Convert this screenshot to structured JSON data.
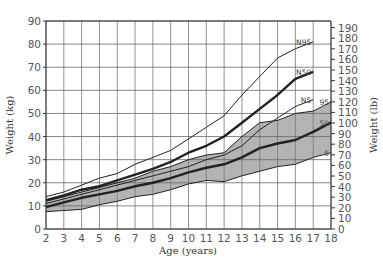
{
  "chart_data": {
    "type": "line",
    "title": "",
    "xlabel": "Age (years)",
    "ylabel": "Weight (kg)",
    "ylabel_right": "Weight (lb)",
    "xlim": [
      2,
      18
    ],
    "ylim": [
      0,
      90
    ],
    "ylim_right": [
      0,
      190
    ],
    "x_ticks": [
      2,
      3,
      4,
      5,
      6,
      7,
      8,
      9,
      10,
      11,
      12,
      13,
      14,
      15,
      16,
      17,
      18
    ],
    "y_ticks": [
      0,
      10,
      20,
      30,
      40,
      50,
      60,
      70,
      80,
      90
    ],
    "y_ticks_right": [
      0,
      10,
      20,
      30,
      40,
      50,
      60,
      70,
      80,
      90,
      100,
      110,
      120,
      130,
      140,
      150,
      160,
      170,
      180,
      190
    ],
    "grid": true,
    "legend": "inline labels at right end of curves",
    "shaded_band": {
      "between": [
        "5",
        "95"
      ],
      "color": "#b3b3b3"
    },
    "series": [
      {
        "name": "N95",
        "style": "thin",
        "x": [
          2,
          3,
          4,
          5,
          6,
          7,
          8,
          9,
          10,
          11,
          12,
          13,
          14,
          15,
          16,
          17
        ],
        "values": [
          14,
          16,
          19,
          22,
          24,
          28,
          31,
          34,
          39,
          44,
          49,
          58,
          66,
          74,
          78,
          81
        ]
      },
      {
        "name": "N50",
        "style": "thick",
        "x": [
          2,
          3,
          4,
          5,
          6,
          7,
          8,
          9,
          10,
          11,
          12,
          13,
          14,
          15,
          16,
          17
        ],
        "values": [
          12.5,
          14.5,
          17,
          18.5,
          21,
          23.5,
          26,
          29,
          33,
          36,
          40,
          46,
          52,
          58,
          65,
          68
        ]
      },
      {
        "name": "N5",
        "style": "thin",
        "x": [
          2,
          3,
          4,
          5,
          6,
          7,
          8,
          9,
          10,
          11,
          12,
          13,
          14,
          15,
          16,
          17
        ],
        "values": [
          11,
          13,
          15,
          17,
          19,
          21,
          23,
          25,
          27,
          30,
          32,
          36,
          43,
          48,
          53,
          56
        ]
      },
      {
        "name": "95",
        "style": "thin",
        "x": [
          2,
          3,
          4,
          5,
          6,
          7,
          8,
          9,
          10,
          11,
          12,
          13,
          14,
          15,
          16,
          17,
          18
        ],
        "values": [
          12,
          14,
          16,
          18,
          20,
          22,
          25,
          27,
          30,
          32,
          33,
          40,
          46,
          47,
          50,
          51,
          55
        ]
      },
      {
        "name": "50",
        "style": "thick",
        "x": [
          2,
          3,
          4,
          5,
          6,
          7,
          8,
          9,
          10,
          11,
          12,
          13,
          14,
          15,
          16,
          17,
          18
        ],
        "values": [
          9.5,
          11.5,
          13.5,
          15,
          16.5,
          18.5,
          20,
          22,
          24.5,
          26.5,
          28,
          31,
          35,
          37,
          38.5,
          42,
          46
        ]
      },
      {
        "name": "5",
        "style": "thin",
        "x": [
          2,
          3,
          4,
          5,
          6,
          7,
          8,
          9,
          10,
          11,
          12,
          13,
          14,
          15,
          16,
          17,
          18
        ],
        "values": [
          7.5,
          8,
          8.5,
          10.5,
          12,
          14,
          15,
          17,
          19.5,
          21,
          20.5,
          23,
          25,
          27,
          28,
          31,
          33
        ]
      }
    ]
  },
  "caption_fragment": "…"
}
